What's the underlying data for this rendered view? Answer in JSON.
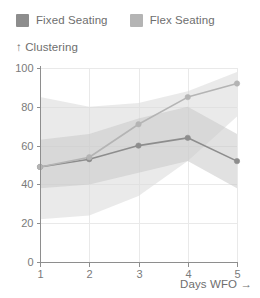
{
  "legend": {
    "position": "top-left",
    "entries": [
      {
        "label": "Fixed Seating",
        "color": "#8d8d8d",
        "swatch_name": "legend-swatch-fixed"
      },
      {
        "label": "Flex Seating",
        "color": "#b4b4b4",
        "swatch_name": "legend-swatch-flex"
      }
    ]
  },
  "axes": {
    "y_title": "↑ Clustering",
    "x_title": "Days WFO →",
    "y_ticks": [
      "0",
      "20",
      "40",
      "60",
      "80",
      "100"
    ],
    "x_ticks": [
      "1",
      "2",
      "3",
      "4",
      "5"
    ]
  },
  "chart_data": {
    "type": "line",
    "title": "",
    "subtitle": "",
    "xlabel": "Days WFO →",
    "ylabel": "↑ Clustering",
    "x": [
      1,
      2,
      3,
      4,
      5
    ],
    "xlim": [
      1,
      5
    ],
    "ylim": [
      0,
      100
    ],
    "xticks": [
      1,
      2,
      3,
      4,
      5
    ],
    "yticks": [
      0,
      20,
      40,
      60,
      80,
      100
    ],
    "grid": true,
    "grid_axis": "both",
    "legend": [
      "Fixed Seating",
      "Flex Seating"
    ],
    "legend_position": "top-left",
    "markers": true,
    "series": [
      {
        "name": "Fixed Seating",
        "color": "#8d8d8d",
        "band_color": "#c9c9c9",
        "band_opacity": 0.55,
        "values": [
          49,
          53,
          60,
          64,
          52
        ],
        "band_lower": [
          38,
          40,
          46,
          52,
          38
        ],
        "band_upper": [
          63,
          66,
          74,
          80,
          66
        ]
      },
      {
        "name": "Flex Seating",
        "color": "#b4b4b4",
        "band_color": "#dcdcdc",
        "band_opacity": 0.6,
        "values": [
          49,
          54,
          71,
          85,
          92
        ],
        "band_lower": [
          22,
          24,
          34,
          52,
          75
        ],
        "band_upper": [
          85,
          80,
          82,
          88,
          98
        ]
      }
    ]
  }
}
